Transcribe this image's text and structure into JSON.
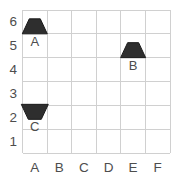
{
  "figure": {
    "background_color": "#ffffff",
    "grid_color": "#d0d0d0",
    "axis_label_color": "#4d4d4d",
    "shape_fill_color": "#2e2e2e",
    "shape_stroke_color": "#1a1a1a",
    "shape_label_color": "#3d3d3d"
  },
  "chart_data": {
    "type": "scatter",
    "title": "",
    "xlabel": "",
    "ylabel": "",
    "grid": {
      "columns": 6,
      "rows": 6,
      "grid_on": true
    },
    "x_axis": {
      "labels": [
        "A",
        "B",
        "C",
        "D",
        "E",
        "F"
      ]
    },
    "y_axis": {
      "labels_top_to_bottom": [
        "6",
        "5",
        "4",
        "3",
        "2",
        "1"
      ]
    },
    "points": [
      {
        "label": "A",
        "column": "A",
        "row": "6",
        "shape": "trapezoid",
        "orientation": "up"
      },
      {
        "label": "B",
        "column": "E",
        "row": "5",
        "shape": "trapezoid",
        "orientation": "up"
      },
      {
        "label": "C",
        "column": "A",
        "row": "2",
        "shape": "trapezoid",
        "orientation": "down"
      }
    ]
  }
}
